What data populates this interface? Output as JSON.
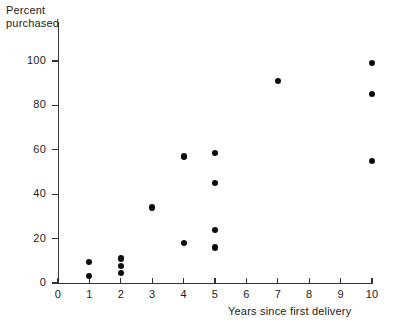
{
  "chart_data": {
    "type": "scatter",
    "title": "",
    "xlabel": "Years since first delivery",
    "ylabel": "Percent\npurchased",
    "ylabel_line1": "Percent",
    "ylabel_line2": "purchased",
    "xlim": [
      0,
      10
    ],
    "ylim": [
      0,
      105
    ],
    "xticks": [
      0,
      1,
      2,
      3,
      4,
      5,
      6,
      7,
      8,
      9,
      10
    ],
    "xticklabels": [
      "0",
      "1",
      "2",
      "3",
      "4",
      "5",
      "6",
      "7",
      "8",
      "9",
      "10"
    ],
    "yticks": [
      0,
      20,
      40,
      60,
      80,
      100
    ],
    "yticklabels": [
      "0",
      "20",
      "40",
      "60",
      "80",
      "100"
    ],
    "grid": false,
    "legend": null,
    "marker": "filled-circle",
    "marker_color": "#0d0d0d",
    "axis_color": "#333333",
    "background": "#ffffff",
    "points": [
      {
        "x": 1,
        "y": 9.5
      },
      {
        "x": 1,
        "y": 3
      },
      {
        "x": 2,
        "y": 11
      },
      {
        "x": 2,
        "y": 7.5
      },
      {
        "x": 2,
        "y": 4.5
      },
      {
        "x": 3,
        "y": 34
      },
      {
        "x": 4,
        "y": 57
      },
      {
        "x": 4,
        "y": 18
      },
      {
        "x": 5,
        "y": 58.5
      },
      {
        "x": 5,
        "y": 45
      },
      {
        "x": 5,
        "y": 24
      },
      {
        "x": 5,
        "y": 16
      },
      {
        "x": 7,
        "y": 91
      },
      {
        "x": 10,
        "y": 99
      },
      {
        "x": 10,
        "y": 85
      },
      {
        "x": 10,
        "y": 55
      }
    ]
  }
}
